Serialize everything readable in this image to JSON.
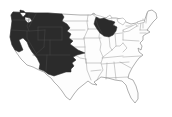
{
  "colors": {
    "background": "#ffffff",
    "land": "#fdfdfd",
    "outline": "#7a7a7a",
    "state_border": "#8f8f8f",
    "lake_fill": "#ffffff",
    "range_fill": "#2b2b2b",
    "range_inner_line": "#4d4d4d"
  },
  "map": {
    "name": "united-states-shaded-range-map",
    "outline_path": "M 13,12 L 35,13 L 48,13 L 62,14 L 80,15 L 91,15 L 94,13 L 97,17 L 102,19 L 108,17 L 112,18 L 116,18 L 121,19 L 126,22 L 131,24 L 136,23 L 141,21 L 144,22 L 146,16 L 148,11 L 152,10 L 156,13 L 157,18 L 153,22 L 150,26 L 147,30 L 150,32 L 146,34 L 143,36 L 143,40 L 140,43 L 142,46 L 141,50 L 138,48 L 139,52 L 143,55 L 139,58 L 136,62 L 132,68 L 129,74 L 128,78 L 133,80 L 136,86 L 138,93 L 138,99 L 135,103 L 131,98 L 128,91 L 126,85 L 122,81 L 115,80 L 108,78 L 101,77 L 97,80 L 94,82 L 97,85 L 92,84 L 88,81 L 83,85 L 78,89 L 74,94 L 70,100 L 66,97 L 62,91 L 58,86 L 54,82 L 51,78 L 47,75 L 44,72 L 39,70 L 33,67 L 27,65 L 21,59 L 16,52 L 12,45 L 10,37 L 11,29 L 12,21 L 11,15 Z",
    "state_lines_path": "M 62,14 L 62,26 M 62,21 L 88,21 M 62,30 L 85,30 M 88,15 L 87,22 L 88,29 M 88,29 L 84,38 M 88,29 L 100,29 M 84,38 L 101,38 M 65,39 L 84,39 M 84,38 L 85,47 L 85,56 M 66,47 L 85,47 M 64,56 L 77,56 L 80,58 L 86,59 M 63,54 L 63,70 M 86,59 L 87,70 L 91,80 M 85,56 L 86,63 M 86,63 L 101,63 M 100,29 L 99,37 L 101,44 L 100,50 L 103,57 L 101,63 L 103,70 L 99,76 L 97,80 M 104,36 L 113,35 M 109,36 L 110,47 L 112,50 M 115,34 L 116,46 M 113,34 L 122,33 M 123,30 L 123,40 M 123,40 L 139,41 M 126,26 L 138,26 M 141,22 L 140,30 M 147,13 L 146,23 M 143,19 L 143,28 M 140,30 L 148,30 M 140,33 L 146,33 M 103,57 L 112,50 M 102,58 L 123,56 M 102,64 L 129,62 M 123,57 L 141,56 M 123,43 L 127,48 L 123,52 M 120,62 L 131,68 M 114,62 L 116,79 M 107,63 L 106,79 M 106,78 L 128,77 M 91,71 L 101,70 M 112,50 L 116,46 L 120,46 L 123,43",
    "lakes_path": "M 92,14 L 100,16 L 106,18 L 110,15 L 112,18 L 104,20 L 96,17 Z M 111,20 L 114,22 L 115,28 L 114,32 L 111,29 L 110,23 Z M 117,19 L 123,18 L 126,21 L 123,25 L 118,22 Z M 123,30 L 130,27 L 136,24 L 137,26 L 129,31 L 124,32 Z M 137,22 L 144,20 L 145,22 L 138,24 Z",
    "shaded_regions": [
      {
        "name": "western-united-states-range",
        "path": "M 13,12 L 35,13 L 48,13 L 62,14 L 64,17 L 62,21 L 67,24 L 70,28 L 67,31 L 71,34 L 69,38 L 73,41 L 70,44 L 74,47 L 78,50 L 85,53 L 77,55 L 73,57 L 76,60 L 72,63 L 74,66 L 71,69 L 71,72 L 66,72 L 60,74 L 54,76 L 48,74 L 44,71 L 39,69 L 40,64 L 37,58 L 32,52 L 29,47 L 27,42 L 23,38 L 19,40 L 21,45 L 23,50 L 19,52 L 15,50 L 12,45 L 10,37 L 11,29 L 12,21 L 11,15 Z M 20,10 L 24,11 L 26,14 L 23,17 L 20,13 Z M 25,17 L 30,18 L 32,21 L 28,23 L 25,20 Z"
      },
      {
        "name": "upper-midwest-range",
        "path": "M 96,17 L 100,19 L 104,18 L 108,20 L 112,21 L 115,22 L 113,25 L 117,27 L 116,31 L 113,35 L 109,37 L 104,36 L 100,33 L 97,29 L 94,24 L 95,20 Z"
      }
    ],
    "range_inner_lines_path": "M 13,20 L 29,20 M 29,14 L 29,20 L 27,26 L 29,31 M 11,30 L 29,31 L 45,30 M 36,14 L 31,23 L 29,27 M 38,27 L 62,27 M 38,27 L 38,40 M 38,40 L 62,40 M 62,27 L 62,40 M 45,30 L 44,47 M 27,31 L 27,38 L 36,53 M 50,40 L 50,55 M 33,55 L 70,55 M 47,55 L 46,71 M 44,47 L 36,54 M 96,20 L 98,26 L 102,33"
  }
}
